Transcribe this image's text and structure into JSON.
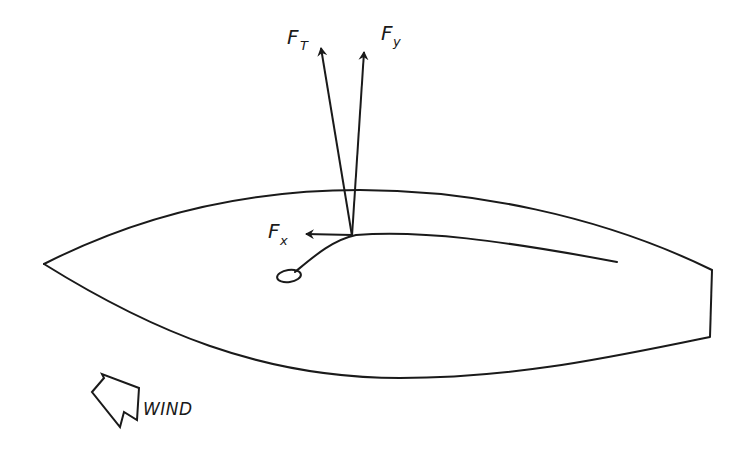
{
  "diagram": {
    "type": "sailboat-force-diagram",
    "stroke_color": "#1a1a1a",
    "background": "#ffffff",
    "forces": [
      {
        "id": "FT",
        "symbol": "F",
        "subscript": "T",
        "description": "total sail force"
      },
      {
        "id": "Fy",
        "symbol": "F",
        "subscript": "y",
        "description": "force component perpendicular to hull"
      },
      {
        "id": "Fx",
        "symbol": "F",
        "subscript": "x",
        "description": "force component along hull, pointing forward"
      }
    ],
    "wind": {
      "label": "WIND",
      "icon": "wind-arrow-icon"
    },
    "elements": [
      "hull-outline",
      "sail-boom-curve",
      "mast-base",
      "transom"
    ]
  }
}
